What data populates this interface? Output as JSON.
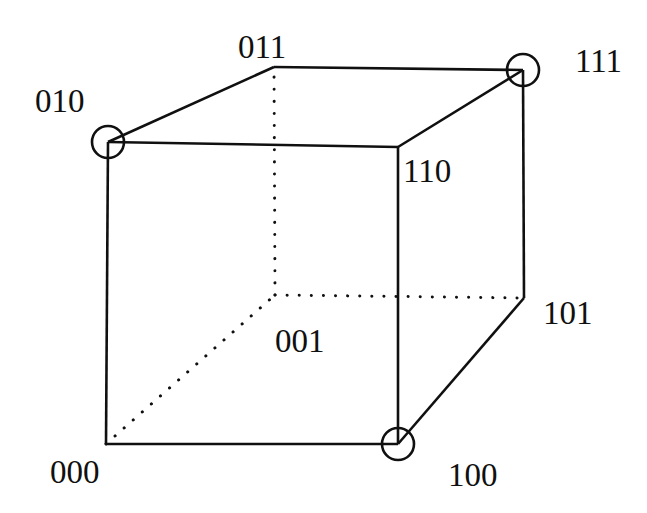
{
  "figure": {
    "kind": "3d-cube-diagram",
    "title": "",
    "background_color": "#ffffff",
    "stroke_color": "#101010",
    "label_color": "#101010",
    "solid_line_width": 2.6,
    "dotted_line_width": 3.0,
    "marker_radius": 16,
    "marker_stroke_width": 2.6
  },
  "chart_data": {
    "type": "diagram",
    "title": "",
    "xlabel": "",
    "ylabel": "",
    "vertices": [
      {
        "code": "000",
        "x": 106,
        "y": 444,
        "marked": false,
        "hidden": false,
        "label_x": 50,
        "label_y": 456
      },
      {
        "code": "010",
        "x": 108,
        "y": 142,
        "marked": true,
        "hidden": false,
        "label_x": 35,
        "label_y": 85
      },
      {
        "code": "110",
        "x": 398,
        "y": 147,
        "marked": false,
        "hidden": false,
        "label_x": 403,
        "label_y": 155
      },
      {
        "code": "100",
        "x": 398,
        "y": 444,
        "marked": true,
        "hidden": false,
        "label_x": 448,
        "label_y": 459
      },
      {
        "code": "001",
        "x": 275,
        "y": 295,
        "marked": false,
        "hidden": true,
        "label_x": 275,
        "label_y": 325
      },
      {
        "code": "011",
        "x": 274,
        "y": 67,
        "marked": false,
        "hidden": false,
        "label_x": 238,
        "label_y": 31
      },
      {
        "code": "111",
        "x": 523,
        "y": 70,
        "marked": true,
        "hidden": false,
        "label_x": 575,
        "label_y": 45
      },
      {
        "code": "101",
        "x": 524,
        "y": 298,
        "marked": false,
        "hidden": false,
        "label_x": 543,
        "label_y": 297
      }
    ],
    "edges": [
      {
        "from": "000",
        "to": "010",
        "style": "solid"
      },
      {
        "from": "010",
        "to": "110",
        "style": "solid"
      },
      {
        "from": "110",
        "to": "100",
        "style": "solid"
      },
      {
        "from": "100",
        "to": "000",
        "style": "solid"
      },
      {
        "from": "010",
        "to": "011",
        "style": "solid"
      },
      {
        "from": "110",
        "to": "111",
        "style": "solid"
      },
      {
        "from": "100",
        "to": "101",
        "style": "solid"
      },
      {
        "from": "011",
        "to": "111",
        "style": "solid"
      },
      {
        "from": "111",
        "to": "101",
        "style": "solid"
      },
      {
        "from": "000",
        "to": "001",
        "style": "dotted"
      },
      {
        "from": "001",
        "to": "011",
        "style": "dotted"
      },
      {
        "from": "001",
        "to": "101",
        "style": "dotted"
      }
    ],
    "marked_vertices": [
      "010",
      "111",
      "100"
    ],
    "legend": [],
    "annotations": []
  }
}
